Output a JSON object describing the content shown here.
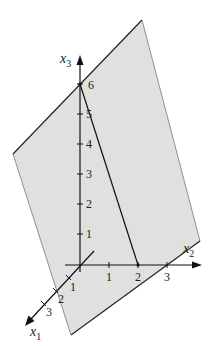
{
  "colors": {
    "plane_fill": "#e0e0e0",
    "plane_edge_dark": "#222222",
    "plane_edge_light": "#777777",
    "axis": "#111111"
  },
  "axes": {
    "x1": {
      "label": "x",
      "subscript": "1",
      "ticks": [
        "1",
        "2",
        "3"
      ]
    },
    "x2": {
      "label": "x",
      "subscript": "2",
      "ticks": [
        "1",
        "2",
        "3"
      ]
    },
    "x3": {
      "label": "x",
      "subscript": "3",
      "ticks": [
        "1",
        "2",
        "3",
        "4",
        "5",
        "6"
      ]
    }
  },
  "plane": {
    "vertices": [
      [
        142,
        20
      ],
      [
        200,
        241
      ],
      [
        71,
        335
      ],
      [
        13,
        154
      ]
    ]
  },
  "intersection_segment": {
    "from_label": "6",
    "to_label": "2"
  }
}
